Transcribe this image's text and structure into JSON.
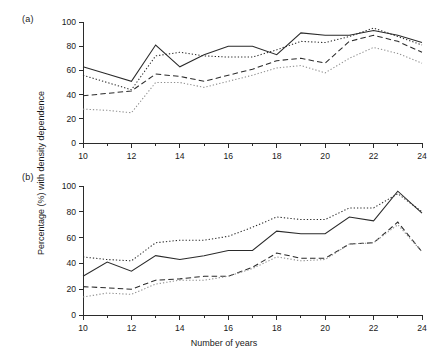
{
  "figure": {
    "panel_a_label": "(a)",
    "panel_b_label": "(b)",
    "ylabel": "Percentage (%) with density dependence",
    "xlabel": "Number of years"
  },
  "chart_data": [
    {
      "type": "line",
      "panel": "(a)",
      "title": "",
      "xlabel": "",
      "ylabel": "Percentage (%) with density dependence",
      "xlim": [
        10,
        24
      ],
      "ylim": [
        0,
        100
      ],
      "xticks": [
        10,
        12,
        14,
        16,
        18,
        20,
        22,
        24
      ],
      "xtick_labels": [
        "10",
        "12",
        "14",
        "16",
        "18",
        "20",
        "22",
        "24"
      ],
      "yticks": [
        0,
        20,
        40,
        60,
        80,
        100
      ],
      "ytick_labels": [
        "0",
        "20",
        "40",
        "60",
        "80",
        "100"
      ],
      "minor_xticks": [
        11,
        13,
        15,
        17,
        19,
        21,
        23
      ],
      "grid": false,
      "legend": false,
      "x": [
        10,
        11,
        12,
        13,
        14,
        15,
        16,
        17,
        18,
        19,
        20,
        21,
        22,
        23,
        24
      ],
      "series": [
        {
          "name": "solid",
          "style": "solid",
          "color": "#2a2a2a",
          "values": [
            63,
            57,
            51,
            81,
            63,
            73,
            80,
            80,
            73,
            91,
            89,
            89,
            93,
            89,
            83
          ]
        },
        {
          "name": "dotted-dark",
          "style": "dotted",
          "color": "#2a2a2a",
          "values": [
            56,
            50,
            44,
            72,
            75,
            72,
            71,
            71,
            77,
            84,
            83,
            88,
            95,
            88,
            81
          ]
        },
        {
          "name": "dashed",
          "style": "dashed",
          "color": "#2a2a2a",
          "values": [
            39,
            41,
            43,
            57,
            55,
            51,
            56,
            61,
            68,
            70,
            66,
            84,
            89,
            84,
            75
          ]
        },
        {
          "name": "dotted-light",
          "style": "dotted",
          "color": "#8e8e8e",
          "values": [
            28,
            27,
            25,
            50,
            50,
            46,
            51,
            56,
            62,
            64,
            58,
            70,
            79,
            74,
            66
          ]
        }
      ]
    },
    {
      "type": "line",
      "panel": "(b)",
      "title": "",
      "xlabel": "Number of years",
      "ylabel": "Percentage (%) with density dependence",
      "xlim": [
        10,
        24
      ],
      "ylim": [
        0,
        100
      ],
      "xticks": [
        10,
        12,
        14,
        16,
        18,
        20,
        22,
        24
      ],
      "xtick_labels": [
        "10",
        "12",
        "14",
        "16",
        "18",
        "20",
        "22",
        "24"
      ],
      "yticks": [
        0,
        20,
        40,
        60,
        80,
        100
      ],
      "ytick_labels": [
        "0",
        "20",
        "40",
        "60",
        "80",
        "100"
      ],
      "minor_xticks": [
        11,
        13,
        15,
        17,
        19,
        21,
        23
      ],
      "grid": false,
      "legend": false,
      "x": [
        10,
        11,
        12,
        13,
        14,
        15,
        16,
        17,
        18,
        19,
        20,
        21,
        22,
        23,
        24
      ],
      "series": [
        {
          "name": "dotted-dark",
          "style": "dotted",
          "color": "#2a2a2a",
          "values": [
            45,
            43,
            42,
            56,
            58,
            58,
            61,
            68,
            76,
            74,
            74,
            83,
            83,
            94,
            80
          ]
        },
        {
          "name": "solid",
          "style": "solid",
          "color": "#2a2a2a",
          "values": [
            30,
            41,
            34,
            46,
            43,
            46,
            50,
            50,
            65,
            63,
            63,
            76,
            73,
            96,
            79
          ]
        },
        {
          "name": "dashed",
          "style": "dashed",
          "color": "#2a2a2a",
          "values": [
            22,
            21,
            20,
            27,
            28,
            30,
            30,
            37,
            48,
            44,
            44,
            55,
            56,
            72,
            49
          ]
        },
        {
          "name": "dotted-light",
          "style": "dotted",
          "color": "#8e8e8e",
          "values": [
            14,
            17,
            16,
            24,
            27,
            27,
            30,
            36,
            45,
            42,
            43,
            55,
            56,
            70,
            49
          ]
        }
      ]
    }
  ]
}
